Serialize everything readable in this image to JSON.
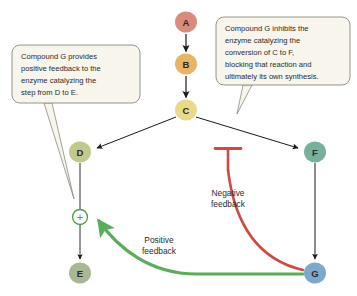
{
  "diagram": {
    "background_color": "#ffffff",
    "nodes": [
      {
        "id": "A",
        "label": "A",
        "color": "#d98b7e",
        "cx": 186,
        "cy": 22,
        "rx": 11,
        "ry": 10.5
      },
      {
        "id": "B",
        "label": "B",
        "color": "#e8b566",
        "cx": 186,
        "cy": 64,
        "rx": 11,
        "ry": 10.5
      },
      {
        "id": "C",
        "label": "C",
        "color": "#ead98a",
        "cx": 186,
        "cy": 110,
        "rx": 11,
        "ry": 10.5
      },
      {
        "id": "D",
        "label": "D",
        "color": "#c2c98d",
        "cx": 80,
        "cy": 152,
        "rx": 11,
        "ry": 10.5
      },
      {
        "id": "E",
        "label": "E",
        "color": "#a8b894",
        "cx": 80,
        "cy": 273,
        "rx": 11,
        "ry": 10.5
      },
      {
        "id": "F",
        "label": "F",
        "color": "#78b09e",
        "cx": 315,
        "cy": 152,
        "rx": 11,
        "ry": 10.5
      },
      {
        "id": "G",
        "label": "G",
        "color": "#7da8cc",
        "cx": 315,
        "cy": 273,
        "rx": 11,
        "ry": 10.5
      }
    ],
    "plus_node": {
      "name": "positive-regulation-point",
      "symbol": "+",
      "color": "#4b9b4b",
      "cx": 80,
      "cy": 217,
      "r": 7.5
    },
    "callouts": [
      {
        "id": "left",
        "name": "callout-positive-feedback",
        "lines": [
          "Compound G provides",
          "positive feedback to the",
          "enzyme catalyzing the",
          "step from D to E."
        ],
        "x": 12,
        "y": 45,
        "width": 128,
        "height": 58,
        "fill": "#f7f5ec",
        "stroke": "#8a8a7e"
      },
      {
        "id": "right",
        "name": "callout-negative-feedback",
        "lines": [
          "Compound G inhibits the",
          "enzyme catalyzing the",
          "conversion of C to F,",
          "blocking that reaction and",
          "ultimately its own synthesis."
        ],
        "x": 216,
        "y": 17,
        "width": 134,
        "height": 68,
        "fill": "#f7f5ec",
        "stroke": "#8a8a7e"
      }
    ],
    "feedback_labels": [
      {
        "id": "negative",
        "name": "negative-feedback-label",
        "lines": [
          "Negative",
          "feedback"
        ],
        "x": 228,
        "y": 196,
        "color": "#2b2b2b"
      },
      {
        "id": "positive",
        "name": "positive-feedback-label",
        "lines": [
          "Positive",
          "feedback"
        ],
        "x": 159,
        "y": 243,
        "color": "#2b2b2b"
      }
    ],
    "colors": {
      "arrow": "#1a1a1a",
      "inhibition": "#cf4a42",
      "activation": "#5aad5a",
      "callout_fill": "#f7f5ec",
      "callout_stroke": "#8a8a7e"
    }
  }
}
